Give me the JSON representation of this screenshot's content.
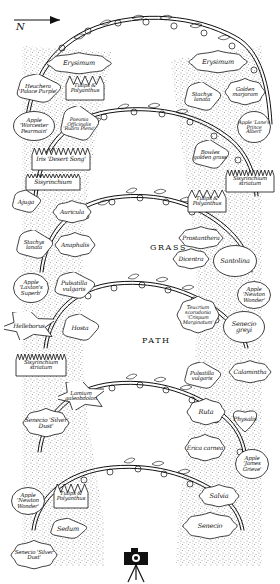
{
  "plan": {
    "title": "Apple arch garden plan",
    "compass": {
      "label": "N",
      "direction": "right"
    },
    "areas": [
      {
        "name": "grass",
        "label": "GRASS",
        "x": 150,
        "y": 243
      },
      {
        "name": "path",
        "label": "PATH",
        "x": 142,
        "y": 336
      }
    ],
    "camera_icon": "camera-tripod-icon",
    "beds": [
      {
        "id": "erysimum-left",
        "label": "Erysimum",
        "shape": "wavy",
        "x": 46,
        "y": 52,
        "w": 66,
        "h": 23,
        "size": "t65"
      },
      {
        "id": "heuchera",
        "label": "Heuchera 'Palace Purple'",
        "shape": "cloud",
        "x": 14,
        "y": 74,
        "w": 48,
        "h": 30,
        "size": "t55"
      },
      {
        "id": "tulips-polyanthus-1",
        "label": "Tulips & Polyanthus",
        "shape": "spiky",
        "x": 64,
        "y": 74,
        "w": 42,
        "h": 28,
        "size": "t55"
      },
      {
        "id": "apple-worcester",
        "label": "Apple 'Worcester Pearmain'",
        "shape": "round",
        "x": 12,
        "y": 110,
        "w": 44,
        "h": 32,
        "size": "t55"
      },
      {
        "id": "paeonia",
        "label": "Paeonia Officinalis 'Rubra Plena'",
        "shape": "cloud",
        "x": 58,
        "y": 106,
        "w": 42,
        "h": 36,
        "size": "t5"
      },
      {
        "id": "iris-desert-song",
        "label": "Iris 'Desert Song'",
        "shape": "zigzag",
        "x": 30,
        "y": 146,
        "w": 62,
        "h": 26,
        "size": "t6"
      },
      {
        "id": "sisyrinchium-1",
        "label": "Sisyrinchium",
        "shape": "comb",
        "x": 24,
        "y": 172,
        "w": 58,
        "h": 20,
        "size": "t6"
      },
      {
        "id": "ajuga",
        "label": "Ajuga",
        "shape": "cloud",
        "x": 10,
        "y": 190,
        "w": 32,
        "h": 24,
        "size": "t6"
      },
      {
        "id": "auricula",
        "label": "Auricula",
        "shape": "wavy",
        "x": 52,
        "y": 200,
        "w": 40,
        "h": 24,
        "size": "t6"
      },
      {
        "id": "stachys-lanata-left",
        "label": "Stachys lanata",
        "shape": "cloud",
        "x": 14,
        "y": 230,
        "w": 40,
        "h": 30,
        "size": "t55"
      },
      {
        "id": "anaphalis",
        "label": "Anaphalis",
        "shape": "wavy",
        "x": 54,
        "y": 232,
        "w": 42,
        "h": 26,
        "size": "t6"
      },
      {
        "id": "apple-laxtons",
        "label": "Apple 'Laxton's Superb'",
        "shape": "round",
        "x": 12,
        "y": 272,
        "w": 38,
        "h": 32,
        "size": "t55"
      },
      {
        "id": "pulsatilla-1",
        "label": "Pulsatilla vulgaris",
        "shape": "cloud",
        "x": 52,
        "y": 272,
        "w": 44,
        "h": 28,
        "size": "t6"
      },
      {
        "id": "helleborus",
        "label": "Helleborus",
        "shape": "star",
        "x": 4,
        "y": 312,
        "w": 50,
        "h": 28,
        "size": "t6"
      },
      {
        "id": "hosta",
        "label": "Hosta",
        "shape": "cloud",
        "x": 60,
        "y": 314,
        "w": 40,
        "h": 28,
        "size": "t6"
      },
      {
        "id": "sisyrinchium-striatum-left",
        "label": "Sisyrinchium striatum",
        "shape": "comb",
        "x": 14,
        "y": 352,
        "w": 54,
        "h": 26,
        "size": "t55"
      },
      {
        "id": "lamium",
        "label": "Lamium galeobdolon",
        "shape": "star",
        "x": 58,
        "y": 382,
        "w": 46,
        "h": 28,
        "size": "t55"
      },
      {
        "id": "senecio-silver-dust-1",
        "label": "Senecio 'Silver Dust'",
        "shape": "wavy",
        "x": 22,
        "y": 408,
        "w": 48,
        "h": 30,
        "size": "t6"
      },
      {
        "id": "apple-newton-wonder-2",
        "label": "Apple 'Newton Wonder'",
        "shape": "round",
        "x": 10,
        "y": 486,
        "w": 36,
        "h": 30,
        "size": "t55"
      },
      {
        "id": "tulips-polyanthus-3",
        "label": "Tulips & Polyanthus",
        "shape": "spiky",
        "x": 52,
        "y": 482,
        "w": 38,
        "h": 28,
        "size": "t55"
      },
      {
        "id": "sedum",
        "label": "Sedum",
        "shape": "cloud",
        "x": 48,
        "y": 518,
        "w": 40,
        "h": 22,
        "size": "t65"
      },
      {
        "id": "senecio-silver-dust-2",
        "label": "Senecio 'Silver Dust'",
        "shape": "wavy",
        "x": 10,
        "y": 540,
        "w": 48,
        "h": 30,
        "size": "t55"
      },
      {
        "id": "erysimum-right",
        "label": "Erysimum",
        "shape": "wavy",
        "x": 188,
        "y": 50,
        "w": 60,
        "h": 24,
        "size": "t65"
      },
      {
        "id": "stachys-lanata-right",
        "label": "Stachys lanata",
        "shape": "cloud",
        "x": 182,
        "y": 82,
        "w": 40,
        "h": 30,
        "size": "t55"
      },
      {
        "id": "golden-marjoram",
        "label": "Golden marjoram",
        "shape": "wavy",
        "x": 224,
        "y": 78,
        "w": 42,
        "h": 28,
        "size": "t55"
      },
      {
        "id": "apple-lanes-prince",
        "label": "Apple 'Lane's Prince Albert'",
        "shape": "round",
        "x": 236,
        "y": 110,
        "w": 36,
        "h": 34,
        "size": "t5"
      },
      {
        "id": "bowles-golden-grass",
        "label": "Bowles golden grass",
        "shape": "cloud",
        "x": 190,
        "y": 140,
        "w": 40,
        "h": 30,
        "size": "t55"
      },
      {
        "id": "sisyrinchium-striatum-right",
        "label": "Sisyrinchium striatum",
        "shape": "comb",
        "x": 224,
        "y": 168,
        "w": 52,
        "h": 26,
        "size": "t55"
      },
      {
        "id": "tulips-polyanthus-2",
        "label": "Tulips & Polyanthus",
        "shape": "spiky",
        "x": 186,
        "y": 188,
        "w": 42,
        "h": 26,
        "size": "t55"
      },
      {
        "id": "prostanthera",
        "label": "Prostanthera",
        "shape": "wavy",
        "x": 178,
        "y": 226,
        "w": 46,
        "h": 24,
        "size": "t6"
      },
      {
        "id": "dicentra",
        "label": "Dicentra",
        "shape": "wavy",
        "x": 172,
        "y": 248,
        "w": 38,
        "h": 22,
        "size": "t6"
      },
      {
        "id": "santolina",
        "label": "Santolina",
        "shape": "round",
        "x": 212,
        "y": 244,
        "w": 46,
        "h": 34,
        "size": "t65"
      },
      {
        "id": "apple-newton-wonder-1",
        "label": "Apple 'Newton Wonder'",
        "shape": "round",
        "x": 236,
        "y": 280,
        "w": 36,
        "h": 30,
        "size": "t55"
      },
      {
        "id": "teucrium",
        "label": "Teucrium scorodonia 'Crispum Marginatum'",
        "shape": "wavy",
        "x": 176,
        "y": 296,
        "w": 44,
        "h": 38,
        "size": "t5"
      },
      {
        "id": "senecio-greyi",
        "label": "Senecio greyi",
        "shape": "round",
        "x": 222,
        "y": 310,
        "w": 44,
        "h": 34,
        "size": "t65"
      },
      {
        "id": "pulsatilla-2",
        "label": "Pulsatilla vulgaris",
        "shape": "cloud",
        "x": 182,
        "y": 362,
        "w": 40,
        "h": 28,
        "size": "t55"
      },
      {
        "id": "calamintha",
        "label": "Calamintha",
        "shape": "wavy",
        "x": 228,
        "y": 360,
        "w": 44,
        "h": 24,
        "size": "t6"
      },
      {
        "id": "ruta",
        "label": "Ruta",
        "shape": "wavy",
        "x": 186,
        "y": 398,
        "w": 40,
        "h": 28,
        "size": "t65"
      },
      {
        "id": "physalis",
        "label": "Physalis",
        "shape": "heart",
        "x": 228,
        "y": 404,
        "w": 34,
        "h": 30,
        "size": "t6"
      },
      {
        "id": "erica-carnea",
        "label": "Erica carnea",
        "shape": "wavy",
        "x": 184,
        "y": 434,
        "w": 42,
        "h": 28,
        "size": "t6"
      },
      {
        "id": "apple-james-grieve",
        "label": "Apple 'James Grieve'",
        "shape": "round",
        "x": 234,
        "y": 448,
        "w": 36,
        "h": 32,
        "size": "t55"
      },
      {
        "id": "salvia",
        "label": "Salvia",
        "shape": "wavy",
        "x": 198,
        "y": 484,
        "w": 42,
        "h": 24,
        "size": "t65"
      },
      {
        "id": "senecio-bottom",
        "label": "Senecio",
        "shape": "wavy",
        "x": 182,
        "y": 512,
        "w": 56,
        "h": 28,
        "size": "t65"
      }
    ]
  },
  "colors": {
    "ink": "#1a1a1a",
    "paper": "#ffffff",
    "border_fill": "#d8d8d8"
  }
}
